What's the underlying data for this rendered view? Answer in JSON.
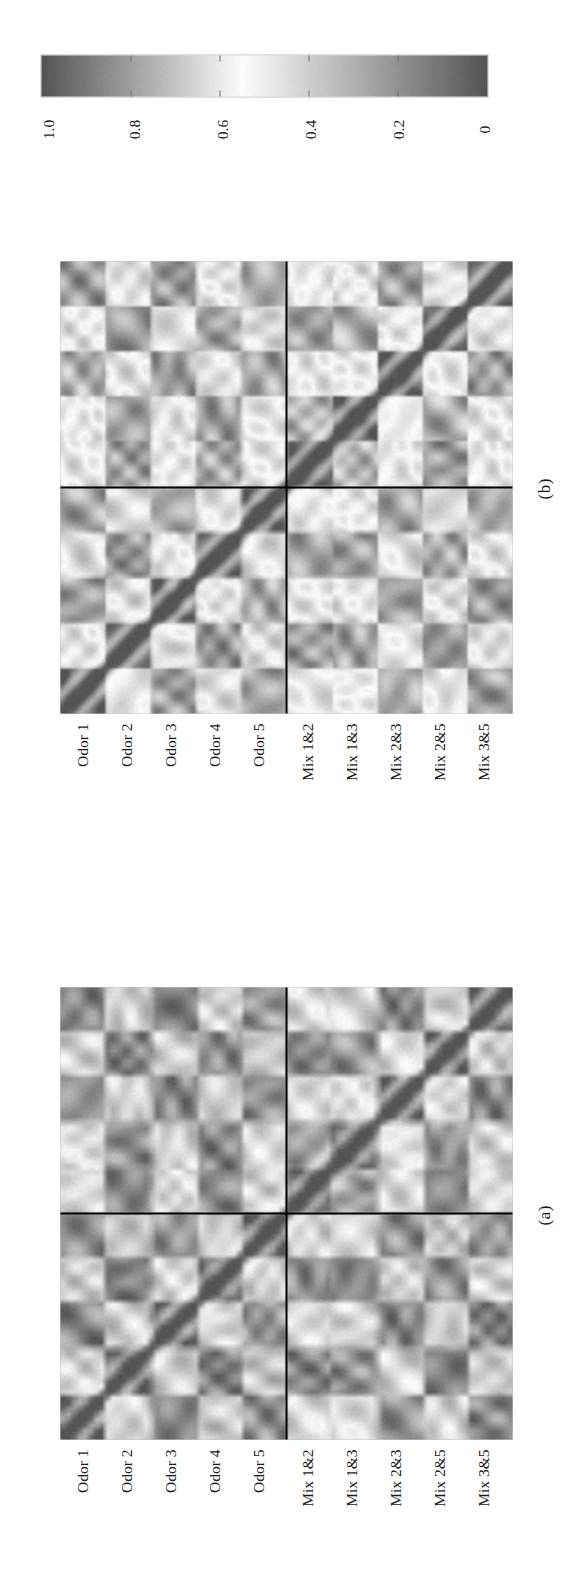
{
  "figure": {
    "orientation": "rotated-90-ccw",
    "background": "#ffffff",
    "ink": "#1a1a1a"
  },
  "panels": [
    {
      "id": "a",
      "label": "(a)",
      "row_labels": [
        "Odor 1",
        "Odor 2",
        "Odor 3",
        "Odor 4",
        "Odor 5",
        "Mix 1&2",
        "Mix 1&3",
        "Mix 2&3",
        "Mix 2&5",
        "Mix 3&5"
      ],
      "n": 10,
      "block_split_after": 5
    },
    {
      "id": "b",
      "label": "(b)",
      "row_labels": [
        "Odor 1",
        "Odor 2",
        "Odor 3",
        "Odor 4",
        "Odor 5",
        "Mix 1&2",
        "Mix 1&3",
        "Mix 2&3",
        "Mix 2&5",
        "Mix 3&5"
      ],
      "n": 10,
      "block_split_after": 5
    }
  ],
  "colorbar": {
    "orientation": "horizontal-in-rotated-space",
    "tick_labels": [
      "1.0",
      "0.8",
      "0.6",
      "0.4",
      "0.2",
      "0"
    ],
    "tick_values": [
      1.0,
      0.8,
      0.6,
      0.4,
      0.2,
      0.0
    ],
    "vmin": 0,
    "vmax": 1,
    "colormap": "gray-peak-at-0.55",
    "dark_end_color": "#555555",
    "light_mid_color": "#fbfbfb"
  },
  "chart_data": {
    "type": "heatmap",
    "title": "",
    "subtitle": "",
    "xlabel": "",
    "ylabel": "",
    "legend_position": "top (colorbar)",
    "grid": false,
    "colorbar": {
      "label": "",
      "ticks": [
        0,
        0.2,
        0.4,
        0.6,
        0.8,
        1.0
      ],
      "ticklabels": [
        "0",
        "0.2",
        "0.4",
        "0.6",
        "0.8",
        "1.0"
      ],
      "range": [
        0,
        1
      ]
    },
    "categories": [
      "Odor 1",
      "Odor 2",
      "Odor 3",
      "Odor 4",
      "Odor 5",
      "Mix 1&2",
      "Mix 1&3",
      "Mix 2&3",
      "Mix 2&5",
      "Mix 3&5"
    ],
    "panels": [
      {
        "name": "(a)",
        "rows": [
          "Odor 1",
          "Odor 2",
          "Odor 3",
          "Odor 4",
          "Odor 5",
          "Mix 1&2",
          "Mix 1&3",
          "Mix 2&3",
          "Mix 2&5",
          "Mix 3&5"
        ],
        "cols": [
          "Odor 1",
          "Odor 2",
          "Odor 3",
          "Odor 4",
          "Odor 5",
          "Mix 1&2",
          "Mix 1&3",
          "Mix 2&3",
          "Mix 2&5",
          "Mix 3&5"
        ],
        "values": [
          [
            1.0,
            0.42,
            0.86,
            0.4,
            0.84,
            0.44,
            0.46,
            0.82,
            0.42,
            0.86
          ],
          [
            0.42,
            1.0,
            0.4,
            0.88,
            0.38,
            0.86,
            0.84,
            0.42,
            0.88,
            0.4
          ],
          [
            0.86,
            0.4,
            1.0,
            0.42,
            0.82,
            0.44,
            0.42,
            0.86,
            0.4,
            0.88
          ],
          [
            0.4,
            0.88,
            0.42,
            1.0,
            0.4,
            0.84,
            0.86,
            0.4,
            0.84,
            0.42
          ],
          [
            0.84,
            0.38,
            0.82,
            0.4,
            1.0,
            0.42,
            0.44,
            0.84,
            0.38,
            0.82
          ],
          [
            0.44,
            0.86,
            0.44,
            0.84,
            0.42,
            1.0,
            0.8,
            0.44,
            0.86,
            0.44
          ],
          [
            0.46,
            0.84,
            0.42,
            0.86,
            0.44,
            0.8,
            1.0,
            0.46,
            0.82,
            0.42
          ],
          [
            0.82,
            0.42,
            0.86,
            0.4,
            0.84,
            0.44,
            0.46,
            1.0,
            0.44,
            0.86
          ],
          [
            0.42,
            0.88,
            0.4,
            0.84,
            0.38,
            0.86,
            0.82,
            0.44,
            1.0,
            0.4
          ],
          [
            0.86,
            0.4,
            0.88,
            0.42,
            0.82,
            0.44,
            0.42,
            0.86,
            0.4,
            1.0
          ]
        ]
      },
      {
        "name": "(b)",
        "rows": [
          "Odor 1",
          "Odor 2",
          "Odor 3",
          "Odor 4",
          "Odor 5",
          "Mix 1&2",
          "Mix 1&3",
          "Mix 2&3",
          "Mix 2&5",
          "Mix 3&5"
        ],
        "cols": [
          "Odor 1",
          "Odor 2",
          "Odor 3",
          "Odor 4",
          "Odor 5",
          "Mix 1&2",
          "Mix 1&3",
          "Mix 2&3",
          "Mix 2&5",
          "Mix 3&5"
        ],
        "values": [
          [
            1.0,
            0.48,
            0.8,
            0.46,
            0.78,
            0.5,
            0.52,
            0.76,
            0.48,
            0.8
          ],
          [
            0.48,
            1.0,
            0.46,
            0.82,
            0.44,
            0.8,
            0.78,
            0.48,
            0.82,
            0.46
          ],
          [
            0.8,
            0.46,
            1.0,
            0.48,
            0.76,
            0.5,
            0.48,
            0.8,
            0.46,
            0.82
          ],
          [
            0.46,
            0.82,
            0.48,
            1.0,
            0.46,
            0.78,
            0.8,
            0.46,
            0.78,
            0.48
          ],
          [
            0.78,
            0.44,
            0.76,
            0.46,
            1.0,
            0.48,
            0.5,
            0.78,
            0.44,
            0.76
          ],
          [
            0.5,
            0.8,
            0.5,
            0.78,
            0.48,
            1.0,
            0.74,
            0.5,
            0.8,
            0.5
          ],
          [
            0.52,
            0.78,
            0.48,
            0.8,
            0.5,
            0.74,
            1.0,
            0.52,
            0.76,
            0.48
          ],
          [
            0.76,
            0.48,
            0.8,
            0.46,
            0.78,
            0.5,
            0.52,
            1.0,
            0.5,
            0.8
          ],
          [
            0.48,
            0.82,
            0.46,
            0.78,
            0.44,
            0.8,
            0.76,
            0.5,
            1.0,
            0.46
          ],
          [
            0.8,
            0.46,
            0.82,
            0.48,
            0.76,
            0.5,
            0.48,
            0.8,
            0.46,
            1.0
          ]
        ]
      }
    ]
  }
}
